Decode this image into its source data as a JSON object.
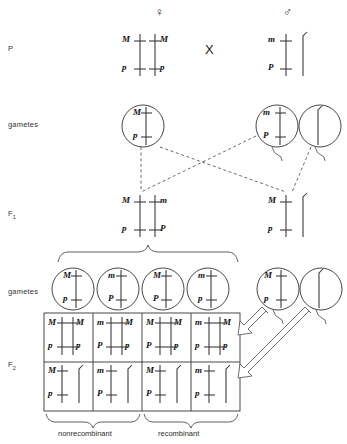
{
  "figure": {
    "symbols": {
      "female": "♀",
      "male": "♂",
      "cross": "X"
    }
  },
  "row_labels": [
    {
      "key": "p",
      "text": "P",
      "sub": ""
    },
    {
      "key": "gametes1",
      "text": "gametes",
      "sub": ""
    },
    {
      "key": "f1",
      "text": "F",
      "sub": "1"
    },
    {
      "key": "gametes2",
      "text": "gametes",
      "sub": ""
    },
    {
      "key": "f2",
      "text": "F",
      "sub": "2"
    }
  ],
  "alleles": {
    "M_dom": "M",
    "m_rec": "m",
    "P_dom": "P",
    "p_rec": "p"
  },
  "p_generation": {
    "female": {
      "sex": "♀",
      "chromosomes": [
        {
          "type": "X",
          "top": "M",
          "bottom": "p",
          "label_side": "left"
        },
        {
          "type": "X",
          "top": "M",
          "bottom": "p",
          "label_side": "right"
        }
      ]
    },
    "male": {
      "sex": "♂",
      "chromosomes": [
        {
          "type": "X",
          "top": "m",
          "bottom": "P",
          "label_side": "left"
        },
        {
          "type": "Y",
          "top": "",
          "bottom": "",
          "label_side": "none"
        }
      ]
    }
  },
  "gametes_p": {
    "female": [
      {
        "type": "X",
        "top": "M",
        "bottom": "p"
      }
    ],
    "male": [
      {
        "type": "X",
        "top": "m",
        "bottom": "P"
      },
      {
        "type": "Y",
        "top": "",
        "bottom": ""
      }
    ]
  },
  "f1_generation": {
    "female": {
      "chromosomes": [
        {
          "type": "X",
          "top": "M",
          "bottom": "p",
          "label_side": "left"
        },
        {
          "type": "X",
          "top": "m",
          "bottom": "P",
          "label_side": "right"
        }
      ]
    },
    "male": {
      "chromosomes": [
        {
          "type": "X",
          "top": "M",
          "bottom": "p",
          "label_side": "left"
        },
        {
          "type": "Y",
          "top": "",
          "bottom": "",
          "label_side": "none"
        }
      ]
    }
  },
  "gametes_f1": {
    "female": [
      {
        "type": "X",
        "top": "M",
        "bottom": "p",
        "class": "nonrecombinant"
      },
      {
        "type": "X",
        "top": "m",
        "bottom": "P",
        "class": "nonrecombinant"
      },
      {
        "type": "X",
        "top": "M",
        "bottom": "P",
        "class": "recombinant"
      },
      {
        "type": "X",
        "top": "m",
        "bottom": "p",
        "class": "recombinant"
      }
    ],
    "male": [
      {
        "type": "X",
        "top": "M",
        "bottom": "p"
      },
      {
        "type": "Y",
        "top": "",
        "bottom": ""
      }
    ]
  },
  "punnett": {
    "columns": 4,
    "rows": [
      {
        "male_gamete": "X (M p)",
        "cells": [
          {
            "left_top": "M",
            "left_bottom": "p",
            "right_top": "M",
            "right_bottom": "p",
            "right_type": "X"
          },
          {
            "left_top": "m",
            "left_bottom": "P",
            "right_top": "M",
            "right_bottom": "p",
            "right_type": "X"
          },
          {
            "left_top": "M",
            "left_bottom": "P",
            "right_top": "M",
            "right_bottom": "p",
            "right_type": "X"
          },
          {
            "left_top": "m",
            "left_bottom": "p",
            "right_top": "M",
            "right_bottom": "p",
            "right_type": "X"
          }
        ]
      },
      {
        "male_gamete": "Y",
        "cells": [
          {
            "left_top": "M",
            "left_bottom": "p",
            "right_top": "",
            "right_bottom": "",
            "right_type": "Y"
          },
          {
            "left_top": "m",
            "left_bottom": "P",
            "right_top": "",
            "right_bottom": "",
            "right_type": "Y"
          },
          {
            "left_top": "M",
            "left_bottom": "P",
            "right_top": "",
            "right_bottom": "",
            "right_type": "Y"
          },
          {
            "left_top": "m",
            "left_bottom": "p",
            "right_top": "",
            "right_bottom": "",
            "right_type": "Y"
          }
        ]
      }
    ]
  },
  "bottom_braces": [
    {
      "key": "nonrecombinant",
      "label": "nonrecombinant",
      "spans_columns": [
        1,
        2
      ]
    },
    {
      "key": "recombinant",
      "label": "recombinant",
      "spans_columns": [
        3,
        4
      ]
    }
  ],
  "colors": {
    "ink": "#1b1b1b",
    "line": "#333333",
    "dashed": "#444444"
  }
}
